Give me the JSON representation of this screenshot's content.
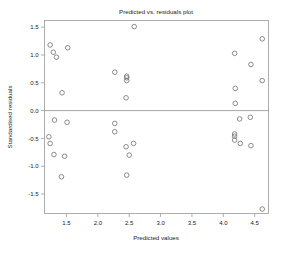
{
  "chart_data": {
    "type": "scatter",
    "title": "Predicted vs. residuals plot",
    "xlabel": "Predicted values",
    "ylabel": "Standardised residuals",
    "xlim": [
      1.15,
      4.72
    ],
    "ylim": [
      -1.85,
      1.62
    ],
    "xticks": [
      1.5,
      2.0,
      2.5,
      3.0,
      3.5,
      4.0,
      4.5
    ],
    "xtick_labels": [
      "1.5",
      "2.0",
      "2.5",
      "3.0",
      "3.5",
      "4.0",
      "4.5"
    ],
    "yticks": [
      1.5,
      1.0,
      0.5,
      0.0,
      -0.5,
      -1.0,
      -1.5
    ],
    "ytick_labels": [
      "1.5",
      "1.0",
      "0.5",
      "0.0",
      "-0.5",
      "-1.0",
      "-1.5"
    ],
    "grid": false,
    "legend": "none",
    "marker": "open-circle",
    "marker_color": "#777777",
    "reference_lines": [
      {
        "axis": "y",
        "value": 0.0,
        "style": "solid",
        "color": "#8e8e8e"
      }
    ],
    "series": [
      {
        "name": "residuals",
        "points": [
          [
            1.24,
            1.18
          ],
          [
            1.29,
            1.05
          ],
          [
            1.34,
            0.96
          ],
          [
            1.52,
            1.13
          ],
          [
            1.43,
            0.32
          ],
          [
            2.27,
            0.69
          ],
          [
            2.46,
            0.62
          ],
          [
            2.46,
            0.59
          ],
          [
            2.46,
            0.54
          ],
          [
            2.45,
            0.23
          ],
          [
            2.58,
            1.51
          ],
          [
            4.18,
            1.03
          ],
          [
            4.44,
            0.83
          ],
          [
            4.62,
            1.29
          ],
          [
            4.62,
            0.54
          ],
          [
            4.19,
            0.4
          ],
          [
            4.19,
            0.13
          ],
          [
            1.31,
            -0.17
          ],
          [
            1.51,
            -0.21
          ],
          [
            1.22,
            -0.47
          ],
          [
            1.24,
            -0.59
          ],
          [
            1.3,
            -0.79
          ],
          [
            1.47,
            -0.82
          ],
          [
            1.42,
            -1.19
          ],
          [
            2.27,
            -0.23
          ],
          [
            2.27,
            -0.38
          ],
          [
            2.45,
            -0.65
          ],
          [
            2.57,
            -0.59
          ],
          [
            2.5,
            -0.8
          ],
          [
            2.46,
            -1.16
          ],
          [
            4.26,
            -0.15
          ],
          [
            4.18,
            -0.42
          ],
          [
            4.18,
            -0.46
          ],
          [
            4.18,
            -0.53
          ],
          [
            4.27,
            -0.59
          ],
          [
            4.43,
            -0.12
          ],
          [
            4.44,
            -0.63
          ],
          [
            4.62,
            -1.77
          ]
        ]
      }
    ]
  }
}
